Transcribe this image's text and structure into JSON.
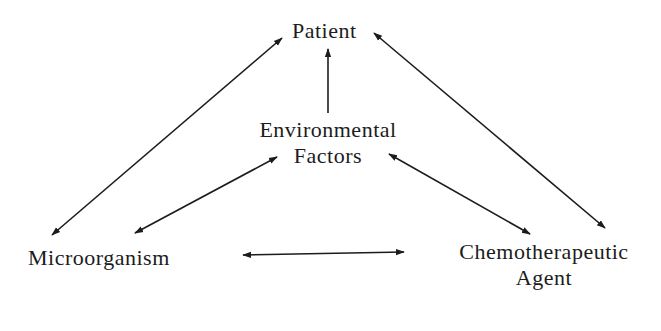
{
  "diagram": {
    "nodes": {
      "patient": {
        "label": "Patient"
      },
      "environmental_factors": {
        "line1": "Environmental",
        "line2": "Factors"
      },
      "microorganism": {
        "label": "Microorganism"
      },
      "chemotherapeutic_agent": {
        "line1": "Chemotherapeutic",
        "line2": "Agent"
      }
    },
    "edges": [
      {
        "from": "Patient",
        "to": "Microorganism",
        "direction": "bidirectional"
      },
      {
        "from": "Patient",
        "to": "Chemotherapeutic Agent",
        "direction": "bidirectional"
      },
      {
        "from": "Environmental Factors",
        "to": "Patient",
        "direction": "one-way"
      },
      {
        "from": "Environmental Factors",
        "to": "Microorganism",
        "direction": "bidirectional"
      },
      {
        "from": "Environmental Factors",
        "to": "Chemotherapeutic Agent",
        "direction": "bidirectional"
      },
      {
        "from": "Microorganism",
        "to": "Chemotherapeutic Agent",
        "direction": "bidirectional"
      }
    ],
    "colors": {
      "ink": "#1c1c1c",
      "background": "#ffffff"
    }
  }
}
